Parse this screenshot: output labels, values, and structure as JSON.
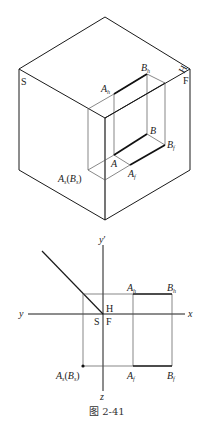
{
  "figure": {
    "caption": "图 2-41",
    "top_view": {
      "plane_labels": {
        "S": "S",
        "F": "F",
        "H": "H"
      },
      "points": {
        "Ah": {
          "base": "A",
          "sub": "h"
        },
        "Bh": {
          "base": "B",
          "sub": "h"
        },
        "B": {
          "base": "B",
          "sub": ""
        },
        "Bf": {
          "base": "B",
          "sub": "f"
        },
        "A": {
          "base": "A",
          "sub": ""
        },
        "Af": {
          "base": "A",
          "sub": "f"
        },
        "As": {
          "base": "A",
          "sub": "s"
        },
        "Bs": {
          "base": "B",
          "sub": "s"
        }
      },
      "paren_open": "(",
      "paren_close": ")"
    },
    "projection_view": {
      "axes": {
        "y_prime": "y",
        "y_prime_mark": "′",
        "y": "y",
        "x": "x",
        "z": "z"
      },
      "origin_labels": {
        "H": "H",
        "S": "S",
        "F": "F"
      },
      "points": {
        "Ah": {
          "base": "A",
          "sub": "h"
        },
        "Bh": {
          "base": "B",
          "sub": "h"
        },
        "Af": {
          "base": "A",
          "sub": "f"
        },
        "Bf": {
          "base": "B",
          "sub": "f"
        },
        "As": {
          "base": "A",
          "sub": "s"
        },
        "Bs": {
          "base": "B",
          "sub": "s"
        }
      },
      "paren_open": "(",
      "paren_close": ")"
    },
    "colors": {
      "line": "#1a1a1a",
      "thin_line": "#555555",
      "background": "#ffffff"
    }
  }
}
